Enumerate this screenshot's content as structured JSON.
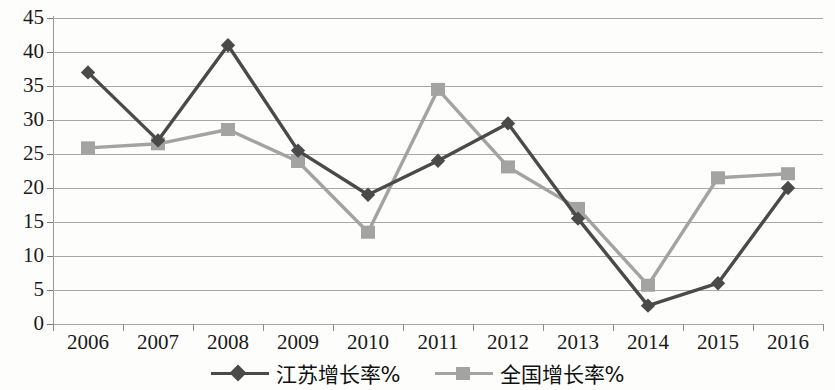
{
  "chart_data": {
    "type": "line",
    "title": "",
    "subtitle": "",
    "xlabel": "",
    "ylabel": "",
    "categories": [
      "2006",
      "2007",
      "2008",
      "2009",
      "2010",
      "2011",
      "2012",
      "2013",
      "2014",
      "2015",
      "2016"
    ],
    "ylim": [
      0,
      45
    ],
    "yticks": [
      0,
      5,
      10,
      15,
      20,
      25,
      30,
      35,
      40,
      45
    ],
    "grid": true,
    "legend_position": "bottom",
    "series": [
      {
        "name": "江苏增长率%",
        "marker": "diamond",
        "color": "#4a4a4a",
        "values": [
          37.0,
          27.0,
          41.0,
          25.5,
          19.0,
          24.0,
          29.5,
          15.5,
          2.7,
          6.0,
          20.0
        ]
      },
      {
        "name": "全国增长率%",
        "marker": "square",
        "color": "#a3a3a3",
        "values": [
          25.9,
          26.5,
          28.6,
          23.9,
          13.5,
          34.5,
          23.1,
          17.0,
          5.7,
          21.5,
          22.1
        ]
      }
    ]
  },
  "axes": {
    "y_tick_labels": [
      "45",
      "40",
      "35",
      "30",
      "25",
      "20",
      "15",
      "10",
      "5",
      "0"
    ],
    "x_tick_labels": [
      "2006",
      "2007",
      "2008",
      "2009",
      "2010",
      "2011",
      "2012",
      "2013",
      "2014",
      "2015",
      "2016"
    ]
  },
  "legend": {
    "entries": [
      {
        "label": "江苏增长率%",
        "marker": "diamond-marker",
        "color": "#4a4a4a"
      },
      {
        "label": "全国增长率%",
        "marker": "square-marker",
        "color": "#a3a3a3"
      }
    ]
  },
  "colors": {
    "series_jiangsu": "#4a4a4a",
    "series_national": "#a3a3a3",
    "gridline": "#a8a8a8",
    "axis": "#8a8a8a",
    "text": "#111111",
    "background": "#fdfdfc"
  }
}
